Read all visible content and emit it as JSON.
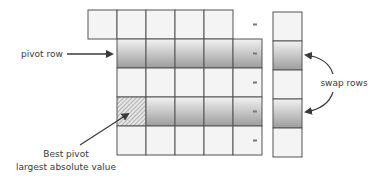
{
  "diagram": {
    "labels": {
      "pivot_row": "pivot row",
      "best_pivot_line1": "Best pivot",
      "best_pivot_line2": "largest absolute value",
      "swap_rows": "swap rows"
    },
    "matrix": {
      "rows": 5,
      "cols": 5,
      "first_row_offset_cols": -1,
      "shaded_rows": [
        1,
        3
      ],
      "hatched_cell": {
        "row": 3,
        "col": 0
      }
    },
    "vector": {
      "rows": 5,
      "shaded_rows": [
        1,
        3
      ]
    },
    "equals_symbol": "=",
    "colors": {
      "grid_line": "#555555",
      "cell_fill": "#f4f4f4",
      "shade_top": "#f2f2f2",
      "shade_bottom": "#9c9c9c",
      "hatch": "#7a7a7a",
      "arrow": "#3a3a3a",
      "text": "#3a3a3a"
    }
  }
}
